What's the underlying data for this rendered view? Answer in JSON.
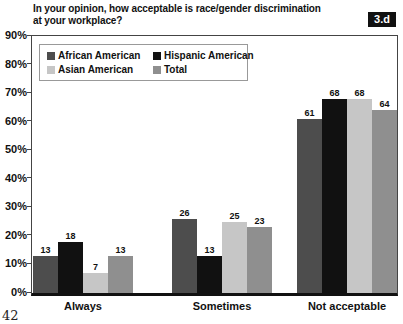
{
  "page": {
    "number": "42"
  },
  "figure": {
    "badge": "3.d",
    "title_lines": [
      "In your opinion, how acceptable is race/gender discrimination",
      "at your workplace?"
    ]
  },
  "chart_data": {
    "type": "bar",
    "title": "In your opinion, how acceptable is race/gender discrimination at your workplace?",
    "categories": [
      "Always",
      "Sometimes",
      "Not acceptable"
    ],
    "series": [
      {
        "name": "African American",
        "color": "#4d4d4d",
        "values": [
          13,
          26,
          61
        ]
      },
      {
        "name": "Hispanic American",
        "color": "#111111",
        "values": [
          18,
          13,
          68
        ]
      },
      {
        "name": "Asian American",
        "color": "#c6c6c6",
        "values": [
          7,
          25,
          68
        ]
      },
      {
        "name": "Total",
        "color": "#8f8f8f",
        "values": [
          13,
          23,
          64
        ]
      }
    ],
    "xlabel": "",
    "ylabel": "",
    "ylim": [
      0,
      90
    ],
    "y_ticks": [
      "90%",
      "80%",
      "70%",
      "60%",
      "50%",
      "40%",
      "30%",
      "20%",
      "10%",
      "0%"
    ],
    "grid": false,
    "legend_position": "top-left-inside",
    "value_labels": true
  }
}
